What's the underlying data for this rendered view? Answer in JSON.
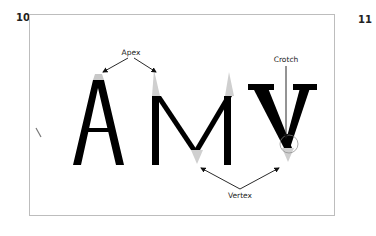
{
  "pages": {
    "left": "10",
    "right": "11"
  },
  "diagram": {
    "letters": [
      "A",
      "M",
      "V"
    ],
    "labels": {
      "apex": "Apex",
      "crotch": "Crotch",
      "vertex": "Vertex"
    },
    "colors": {
      "glyph": "#000000",
      "highlight": "#cccccc",
      "frame": "#bdbdbd",
      "arrow": "#111111"
    }
  }
}
